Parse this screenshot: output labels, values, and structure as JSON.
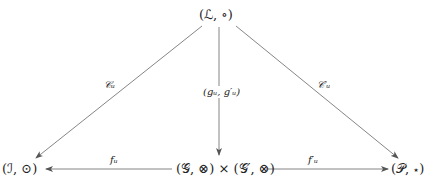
{
  "diagram": {
    "type": "commutative-diagram",
    "nodes": {
      "top": "(ℒ, ∘)",
      "left": "(ℐ, ⊙)",
      "center": "(𝒢, ⊗) × (𝒢′, ⊗)",
      "right": "(𝒫, ⋆)"
    },
    "arrows": {
      "top_to_left": "𝒞ᵤ",
      "top_to_center": "(gᵤ, g′ᵤ)",
      "top_to_right": "𝒞′ᵤ",
      "center_to_left": "fᵤ",
      "center_to_right": "f′ᵤ"
    },
    "edges": [
      {
        "from": "top",
        "to": "left",
        "label": "𝒞ᵤ"
      },
      {
        "from": "top",
        "to": "center",
        "label": "(gᵤ, g′ᵤ)"
      },
      {
        "from": "top",
        "to": "right",
        "label": "𝒞′ᵤ"
      },
      {
        "from": "center",
        "to": "left",
        "label": "fᵤ"
      },
      {
        "from": "center",
        "to": "right",
        "label": "f′ᵤ"
      }
    ],
    "colors": {
      "line": "#555555",
      "text": "#222222"
    }
  }
}
